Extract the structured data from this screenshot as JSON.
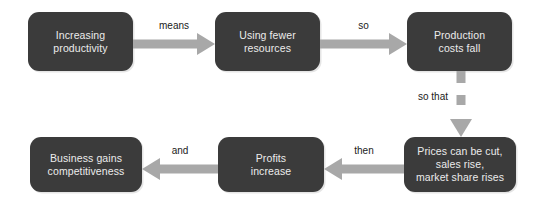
{
  "diagram": {
    "colors": {
      "node_fill": "#3b3b3b",
      "node_text": "#ececec",
      "arrow": "#a8a8a8",
      "label_text": "#1a1a1a",
      "background": "#ffffff"
    },
    "nodes": [
      {
        "id": "increasing-productivity",
        "label": "Increasing\nproductivity"
      },
      {
        "id": "using-fewer-resources",
        "label": "Using fewer\nresources"
      },
      {
        "id": "production-costs-fall",
        "label": "Production\ncosts fall"
      },
      {
        "id": "prices-cut-sales-rise",
        "label": "Prices can be cut,\nsales rise,\nmarket share rises"
      },
      {
        "id": "profits-increase",
        "label": "Profits\nincrease"
      },
      {
        "id": "business-gains-competitiveness",
        "label": "Business gains\ncompetitiveness"
      }
    ],
    "edges": [
      {
        "id": "edge-means",
        "label": "means",
        "from": "increasing-productivity",
        "to": "using-fewer-resources",
        "direction": "right"
      },
      {
        "id": "edge-so",
        "label": "so",
        "from": "using-fewer-resources",
        "to": "production-costs-fall",
        "direction": "right"
      },
      {
        "id": "edge-so-that",
        "label": "so that",
        "from": "production-costs-fall",
        "to": "prices-cut-sales-rise",
        "direction": "down"
      },
      {
        "id": "edge-then",
        "label": "then",
        "from": "prices-cut-sales-rise",
        "to": "profits-increase",
        "direction": "left"
      },
      {
        "id": "edge-and",
        "label": "and",
        "from": "profits-increase",
        "to": "business-gains-competitiveness",
        "direction": "left"
      }
    ]
  }
}
